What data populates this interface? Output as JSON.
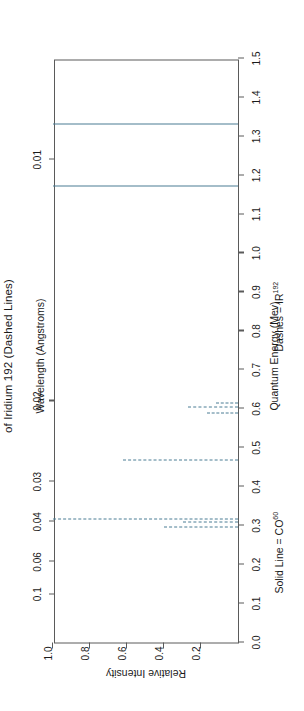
{
  "figure": {
    "title": "of Iridium 192 (Dashed Lines)",
    "legend": {
      "solid_prefix": "Solid Line = CO",
      "solid_sup": "60",
      "dashed_prefix": "Dashes = IR",
      "dashed_sup": "192"
    }
  },
  "chart_data": {
    "type": "bar",
    "title": "of Iridium 192 (Dashed Lines)",
    "xlabel": "Quantum Energy (Mev)",
    "ylabel": "Relative Intensity",
    "top_axis_label": "Wavelength (Angstroms)",
    "xlim": [
      0.0,
      1.5
    ],
    "ylim": [
      0.0,
      1.0
    ],
    "x_reversed": false,
    "grid": false,
    "legend_position": "below-axis",
    "x_ticks": [
      "0.0",
      "0.1",
      "0.2",
      "0.3",
      "0.4",
      "0.5",
      "0.6",
      "0.7",
      "0.8",
      "0.9",
      "1.0",
      "1.1",
      "1.2",
      "1.3",
      "1.4",
      "1.5"
    ],
    "x_tick_values": [
      0.0,
      0.1,
      0.2,
      0.3,
      0.4,
      0.5,
      0.6,
      0.7,
      0.8,
      0.9,
      1.0,
      1.1,
      1.2,
      1.3,
      1.4,
      1.5
    ],
    "y_ticks": [
      "0.2",
      "0.4",
      "0.6",
      "0.8",
      "1.0"
    ],
    "y_tick_values": [
      0.2,
      0.4,
      0.6,
      0.8,
      1.0
    ],
    "top_ticks": [
      "0.1",
      "0.06",
      "0.04",
      "0.03",
      "0.02",
      "0.01"
    ],
    "top_tick_energy": [
      0.124,
      0.207,
      0.31,
      0.413,
      0.62,
      1.24
    ],
    "series": [
      {
        "name": "Solid Line = CO60",
        "style": "solid",
        "color": "#4a7c94",
        "points": [
          {
            "energy": 1.17,
            "intensity": 1.0
          },
          {
            "energy": 1.33,
            "intensity": 1.0
          }
        ]
      },
      {
        "name": "Dashes = IR192",
        "style": "dashed",
        "color": "#4a7c94",
        "points": [
          {
            "energy": 0.296,
            "intensity": 0.4
          },
          {
            "energy": 0.308,
            "intensity": 0.3
          },
          {
            "energy": 0.317,
            "intensity": 1.0
          },
          {
            "energy": 0.468,
            "intensity": 0.62
          },
          {
            "energy": 0.589,
            "intensity": 0.17
          },
          {
            "energy": 0.604,
            "intensity": 0.27
          },
          {
            "energy": 0.613,
            "intensity": 0.12
          }
        ]
      }
    ]
  }
}
